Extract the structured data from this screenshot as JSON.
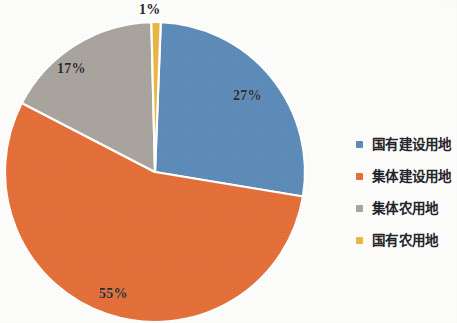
{
  "chart_data": {
    "type": "pie",
    "title": "",
    "subtitle": "",
    "xlabel": "",
    "ylabel": "",
    "legend_position": "right",
    "grid": false,
    "categories": [
      "国有建设用地",
      "集体建设用地",
      "集体农用地",
      "国有农用地"
    ],
    "values": [
      27,
      55,
      17,
      1
    ],
    "value_labels": [
      "27%",
      "55%",
      "17%",
      "1%"
    ],
    "units": "%",
    "colors": [
      "#5e8cb8",
      "#e4703a",
      "#a9a49d",
      "#e9b742"
    ],
    "slices": [
      {
        "label": "国有建设用地",
        "value": 27,
        "display": "27%",
        "color": "#5e8cb8"
      },
      {
        "label": "集体建设用地",
        "value": 55,
        "display": "55%",
        "color": "#e4703a"
      },
      {
        "label": "集体农用地",
        "value": 17,
        "display": "17%",
        "color": "#a9a49d"
      },
      {
        "label": "国有农用地",
        "value": 1,
        "display": "1%",
        "color": "#e9b742"
      }
    ]
  },
  "pie": {
    "label_gold": "1%",
    "label_blue": "27%",
    "label_gray": "17%",
    "label_orange": "55%"
  },
  "legend": {
    "items": [
      {
        "label": "国有建设用地",
        "color": "#5e8cb8"
      },
      {
        "label": "集体建设用地",
        "color": "#e4703a"
      },
      {
        "label": "集体农用地",
        "color": "#a9a49d"
      },
      {
        "label": "国有农用地",
        "color": "#e9b742"
      }
    ]
  },
  "palette": {
    "background": "#fdfdfb",
    "text": "#24242a",
    "slice_separator": "#ffffff"
  }
}
